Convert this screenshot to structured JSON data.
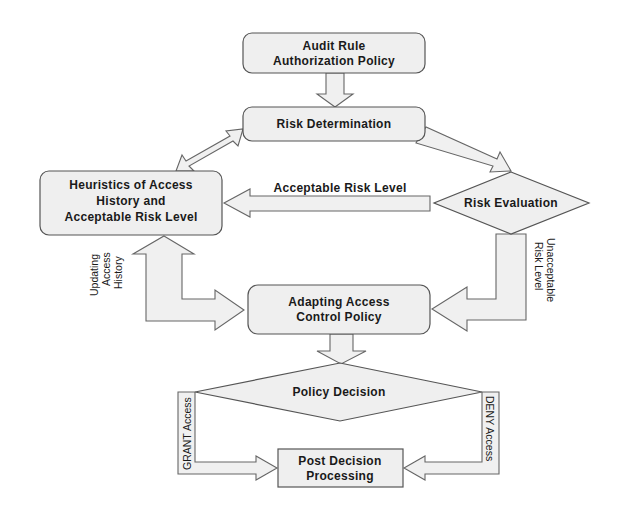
{
  "colors": {
    "background": "#ffffff",
    "node_fill": "#efefef",
    "node_stroke": "#555555",
    "arrow_fill": "#f0f0f0",
    "text": "#1a1a1a"
  },
  "nodes": {
    "audit_rule": {
      "shape": "rounded-rect",
      "line1": "Audit Rule",
      "line2": "Authorization Policy"
    },
    "risk_determination": {
      "shape": "rounded-rect",
      "label": "Risk Determination"
    },
    "heuristics": {
      "shape": "rounded-rect",
      "line1": "Heuristics of Access",
      "line2": "History and",
      "line3": "Acceptable Risk Level"
    },
    "risk_evaluation": {
      "shape": "diamond",
      "label": "Risk Evaluation"
    },
    "adapting_policy": {
      "shape": "rounded-rect",
      "line1": "Adapting Access",
      "line2": "Control Policy"
    },
    "policy_decision": {
      "shape": "diamond",
      "label": "Policy Decision"
    },
    "post_decision": {
      "shape": "rect",
      "line1": "Post Decision",
      "line2": "Processing"
    }
  },
  "edges": [
    {
      "from": "audit_rule",
      "to": "risk_determination",
      "label": ""
    },
    {
      "from": "risk_determination",
      "to": "heuristics",
      "label": "",
      "bidirectional": true
    },
    {
      "from": "risk_determination",
      "to": "risk_evaluation",
      "label": ""
    },
    {
      "from": "risk_evaluation",
      "to": "heuristics",
      "label": "Acceptable Risk Level"
    },
    {
      "from": "risk_evaluation",
      "to": "adapting_policy",
      "label": "Unacceptable Risk Level"
    },
    {
      "from": "adapting_policy",
      "to": "heuristics",
      "label": "Updating Access History",
      "bidirectional": true
    },
    {
      "from": "adapting_policy",
      "to": "policy_decision",
      "label": ""
    },
    {
      "from": "policy_decision",
      "to": "post_decision",
      "label": "GRANT Access"
    },
    {
      "from": "policy_decision",
      "to": "post_decision",
      "label": "DENY Access"
    }
  ],
  "edge_labels": {
    "acceptable": "Acceptable Risk Level",
    "unacceptable_line1": "Unacceptable",
    "unacceptable_line2": "Risk Level",
    "updating_line1": "Updating",
    "updating_line2": "Access",
    "updating_line3": "History",
    "grant": "GRANT Access",
    "deny": "DENY Access"
  }
}
